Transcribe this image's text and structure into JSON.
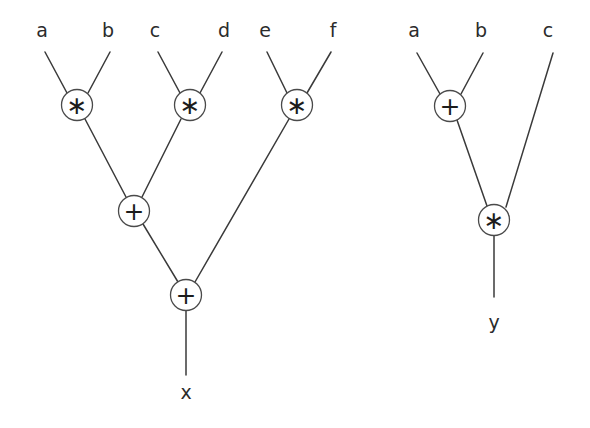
{
  "diagram": {
    "background_color": "#ffffff",
    "line_color": "#3a3a3a",
    "text_color": "#1c1c1c"
  },
  "trees": [
    {
      "name": "left-tree",
      "expression": "x = a*b + c*d + e*f",
      "output_label": "x",
      "leaves": [
        {
          "id": "leaf-a",
          "label": "a",
          "x": 42,
          "y": 30
        },
        {
          "id": "leaf-b",
          "label": "b",
          "x": 108,
          "y": 30
        },
        {
          "id": "leaf-c",
          "label": "c",
          "x": 155,
          "y": 30
        },
        {
          "id": "leaf-d",
          "label": "d",
          "x": 224,
          "y": 30
        },
        {
          "id": "leaf-e",
          "label": "e",
          "x": 265,
          "y": 30
        },
        {
          "id": "leaf-f",
          "label": "f",
          "x": 333,
          "y": 30
        }
      ],
      "nodes": [
        {
          "id": "mul-1",
          "label": "∗",
          "op": "times",
          "cx": 77,
          "cy": 105,
          "r": 15.5
        },
        {
          "id": "mul-2",
          "label": "∗",
          "op": "times",
          "cx": 190,
          "cy": 105,
          "r": 15.5
        },
        {
          "id": "mul-3",
          "label": "∗",
          "op": "times",
          "cx": 297,
          "cy": 105,
          "r": 15.5
        },
        {
          "id": "add-1",
          "label": "+",
          "op": "plus",
          "cx": 134,
          "cy": 211,
          "r": 15.5
        },
        {
          "id": "add-2",
          "label": "+",
          "op": "plus",
          "cx": 186,
          "cy": 295,
          "r": 15.5
        }
      ],
      "output": {
        "id": "out-x",
        "label": "x",
        "x": 186,
        "y": 392
      }
    },
    {
      "name": "right-tree",
      "expression": "y = (a+b)*c",
      "output_label": "y",
      "leaves": [
        {
          "id": "leaf-a2",
          "label": "a",
          "x": 414,
          "y": 30
        },
        {
          "id": "leaf-b2",
          "label": "b",
          "x": 481,
          "y": 30
        },
        {
          "id": "leaf-c2",
          "label": "c",
          "x": 548,
          "y": 30
        }
      ],
      "nodes": [
        {
          "id": "add-3",
          "label": "+",
          "op": "plus",
          "cx": 450,
          "cy": 106,
          "r": 15.5
        },
        {
          "id": "mul-4",
          "label": "∗",
          "op": "times",
          "cx": 494,
          "cy": 220,
          "r": 15.5
        }
      ],
      "output": {
        "id": "out-y",
        "label": "y",
        "x": 494,
        "y": 322
      }
    }
  ]
}
